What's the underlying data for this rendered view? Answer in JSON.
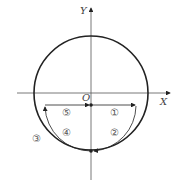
{
  "axes": {
    "x_label": "X",
    "y_label": "Y",
    "origin_label": "O"
  },
  "regions": [
    {
      "id": 1,
      "label": "①"
    },
    {
      "id": 2,
      "label": "②"
    },
    {
      "id": 3,
      "label": "③"
    },
    {
      "id": 4,
      "label": "④"
    },
    {
      "id": 5,
      "label": "⑤"
    }
  ],
  "colors": {
    "stroke": "#222222",
    "axis": "#555555"
  }
}
